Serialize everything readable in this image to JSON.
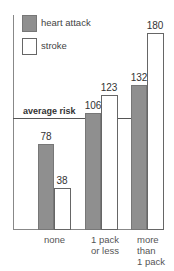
{
  "chart_data": {
    "type": "bar",
    "title": "",
    "xlabel": "",
    "ylabel": "",
    "categories": [
      "none",
      "1 pack or less",
      "more than 1 pack"
    ],
    "category_lines": [
      [
        "none"
      ],
      [
        "1 pack",
        "or less"
      ],
      [
        "more",
        "than",
        "1 pack"
      ]
    ],
    "series": [
      {
        "name": "heart attack",
        "color": "#8f8f8f",
        "values": [
          78,
          106,
          132
        ]
      },
      {
        "name": "stroke",
        "color": "#ffffff",
        "values": [
          38,
          123,
          180
        ]
      }
    ],
    "reference_line": {
      "label": "average risk",
      "value": 101
    },
    "ylim": [
      0,
      190
    ],
    "grid": false,
    "legend_position": "top-left"
  },
  "legend": {
    "items": [
      {
        "label": "heart attack"
      },
      {
        "label": "stroke"
      }
    ]
  },
  "avg_label": "average risk"
}
